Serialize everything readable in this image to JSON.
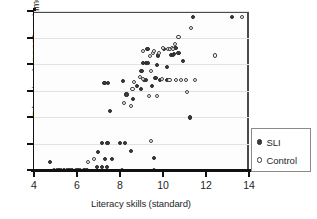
{
  "chart_data": {
    "type": "scatter",
    "title": "",
    "xlabel": "Literacy skills (standard)",
    "ylabel": "Educational (GCSE) attainments",
    "xlim": [
      4,
      14
    ],
    "ylim": [
      0,
      6
    ],
    "xticks": [
      4,
      6,
      8,
      10,
      12,
      14
    ],
    "xticklabels": [
      "4",
      "6",
      "8",
      "10",
      "12",
      "14"
    ],
    "yticks": [
      0,
      1,
      2,
      3,
      4,
      5,
      6
    ],
    "yticklabels": [
      "",
      "",
      "",
      "",
      "",
      "",
      ""
    ],
    "grid": "horizontal",
    "legend_position": "right-outside",
    "series": [
      {
        "name": "SLI",
        "marker": "filled-circle",
        "color": "#3d3d3d",
        "points": [
          [
            4.75,
            0.3
          ],
          [
            5.15,
            0.0
          ],
          [
            5.4,
            0.0
          ],
          [
            5.62,
            0.0
          ],
          [
            5.78,
            0.0
          ],
          [
            6.05,
            0.0
          ],
          [
            6.32,
            0.0
          ],
          [
            6.45,
            0.0
          ],
          [
            6.95,
            0.12
          ],
          [
            7.15,
            0.12
          ],
          [
            7.38,
            0.12
          ],
          [
            6.98,
            0.68
          ],
          [
            7.18,
            1.02
          ],
          [
            7.42,
            1.02
          ],
          [
            7.3,
            0.4
          ],
          [
            7.62,
            0.4
          ],
          [
            7.55,
            2.22
          ],
          [
            7.28,
            3.3
          ],
          [
            7.45,
            3.3
          ],
          [
            8.02,
            1.02
          ],
          [
            8.22,
            1.02
          ],
          [
            8.3,
            2.85
          ],
          [
            8.12,
            3.35
          ],
          [
            8.52,
            0.72
          ],
          [
            8.62,
            2.68
          ],
          [
            8.78,
            3.18
          ],
          [
            9.0,
            3.72
          ],
          [
            8.98,
            3.05
          ],
          [
            9.12,
            3.4
          ],
          [
            9.22,
            3.4
          ],
          [
            9.28,
            4.55
          ],
          [
            9.05,
            4.05
          ],
          [
            9.22,
            4.05
          ],
          [
            9.32,
            4.05
          ],
          [
            9.6,
            0.45
          ],
          [
            9.48,
            3.18
          ],
          [
            9.65,
            3.48
          ],
          [
            9.72,
            3.95
          ],
          [
            9.88,
            3.38
          ],
          [
            9.78,
            4.32
          ],
          [
            10.05,
            4.58
          ],
          [
            10.2,
            3.9
          ],
          [
            10.38,
            4.35
          ],
          [
            10.45,
            4.35
          ],
          [
            10.58,
            4.62
          ],
          [
            10.52,
            4.38
          ],
          [
            10.72,
            4.42
          ],
          [
            10.92,
            4.1
          ],
          [
            11.25,
            1.98
          ],
          [
            11.38,
            5.78
          ],
          [
            13.2,
            5.78
          ],
          [
            10.18,
            3.38
          ]
        ]
      },
      {
        "name": "Control",
        "marker": "open-circle",
        "color": "#3d3d3d",
        "points": [
          [
            4.95,
            0.0
          ],
          [
            5.05,
            0.0
          ],
          [
            5.25,
            0.0
          ],
          [
            5.52,
            0.0
          ],
          [
            5.7,
            0.0
          ],
          [
            5.95,
            0.0
          ],
          [
            6.12,
            0.0
          ],
          [
            6.42,
            0.0
          ],
          [
            6.52,
            0.3
          ],
          [
            6.78,
            0.42
          ],
          [
            8.08,
            0.0
          ],
          [
            8.18,
            2.52
          ],
          [
            8.52,
            2.4
          ],
          [
            8.65,
            3.32
          ],
          [
            8.58,
            3.05
          ],
          [
            8.92,
            3.52
          ],
          [
            9.08,
            3.45
          ],
          [
            9.05,
            4.48
          ],
          [
            9.38,
            4.3
          ],
          [
            9.45,
            3.72
          ],
          [
            9.52,
            4.42
          ],
          [
            9.58,
            4.48
          ],
          [
            9.35,
            2.78
          ],
          [
            9.45,
            1.08
          ],
          [
            9.58,
            0.0
          ],
          [
            9.72,
            2.8
          ],
          [
            9.82,
            4.42
          ],
          [
            9.95,
            3.42
          ],
          [
            10.02,
            4.62
          ],
          [
            10.25,
            4.58
          ],
          [
            10.32,
            4.55
          ],
          [
            10.42,
            4.62
          ],
          [
            10.48,
            4.58
          ],
          [
            10.55,
            4.75
          ],
          [
            10.3,
            3.38
          ],
          [
            10.62,
            3.38
          ],
          [
            10.72,
            5.02
          ],
          [
            10.82,
            3.38
          ],
          [
            11.05,
            3.38
          ],
          [
            11.12,
            2.95
          ],
          [
            11.3,
            5.35
          ],
          [
            11.48,
            3.38
          ],
          [
            12.42,
            4.32
          ],
          [
            13.68,
            5.78
          ]
        ]
      }
    ]
  },
  "legend": {
    "items": [
      {
        "label": "SLI",
        "marker": "filled-circle"
      },
      {
        "label": "Control",
        "marker": "open-circle"
      }
    ]
  }
}
